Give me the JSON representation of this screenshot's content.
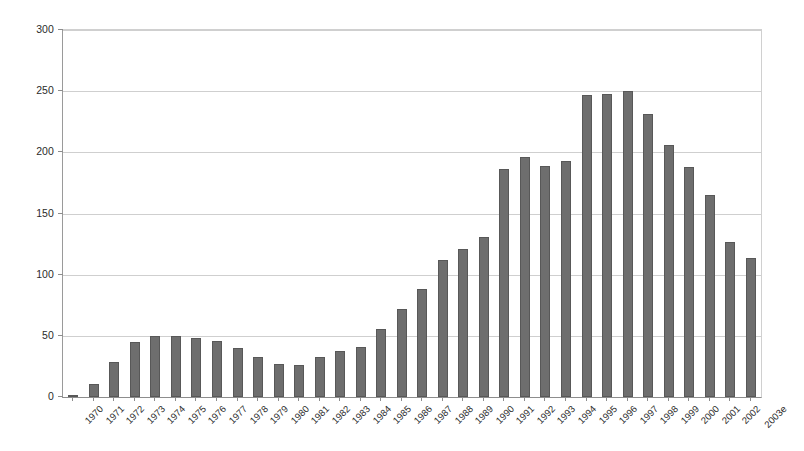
{
  "chart_data": {
    "type": "bar",
    "title": "",
    "subtitle": "",
    "xlabel": "",
    "ylabel": "",
    "ylim": [
      0,
      300
    ],
    "ytick_values": [
      0,
      50,
      100,
      150,
      200,
      250,
      300
    ],
    "ytick_labels": [
      "0",
      "50",
      "100",
      "150",
      "200",
      "250",
      "300"
    ],
    "grid": true,
    "legend": false,
    "legend_position": "none",
    "bar_color": "#6e6e6e",
    "bar_edge_color": "#585858",
    "gridline_color": "#cfcfcf",
    "axis_color": "#8d8d8d",
    "xtick_rotation": -45,
    "categories": [
      "1970",
      "1971",
      "1972",
      "1973",
      "1974",
      "1975",
      "1976",
      "1977",
      "1978",
      "1979",
      "1980",
      "1981",
      "1982",
      "1983",
      "1984",
      "1985",
      "1986",
      "1987",
      "1988",
      "1989",
      "1990",
      "1991",
      "1992",
      "1993",
      "1994",
      "1995",
      "1996",
      "1997",
      "1998",
      "1999",
      "2000",
      "2001",
      "2002",
      "2003e"
    ],
    "values": [
      2,
      11,
      29,
      45,
      50,
      50,
      48,
      46,
      40,
      33,
      27,
      26,
      33,
      38,
      41,
      56,
      72,
      88,
      112,
      121,
      131,
      186,
      196,
      189,
      193,
      247,
      248,
      250,
      231,
      206,
      188,
      165,
      127,
      114
    ]
  }
}
